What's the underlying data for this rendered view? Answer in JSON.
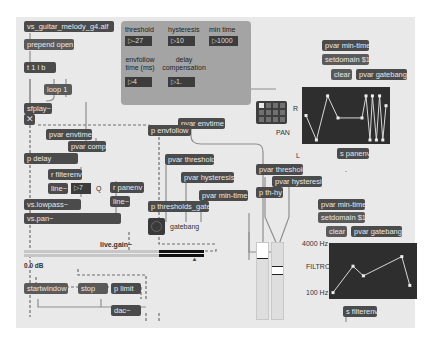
{
  "patch": {
    "objects": {
      "file": "vs_guitar_melody_g4.aif",
      "prepend": "prepend open",
      "trigger": "t 1 l b",
      "loop": "loop 1",
      "sfplay": "sfplay~",
      "pvar_envtime_left": "pvar envtime",
      "pvar_comp": "pvar comp",
      "p_delay": "p delay",
      "r_filterenv": "r filterenv",
      "line_filter": "line~",
      "q_number": "7",
      "q_label": "Q",
      "r_panenv": "r panenv",
      "line_pan": "line~",
      "lowpass": "vs.lowpass~",
      "pan": "vs.pan~",
      "pvar_envtime_right": "pvar envtime",
      "p_envfollow": "p envfollow",
      "pvar_threshold": "pvar threshold",
      "pvar_hysteresis": "pvar hysteresis",
      "pvar_mintime": "pvar min-time",
      "p_thresholds_gate": "p thresholds_gate",
      "gatebang_label": "gatebang",
      "pvar_threshold2": "pvar threshold",
      "pvar_hysteresis2": "pvar hysteresis",
      "p_thhy": "p th-hy",
      "live_gain_label": "live.gain~",
      "gain_value": "0.0 dB",
      "startwindow": "startwindow",
      "stop": "stop",
      "p_limit": "p limit",
      "dac": "dac~",
      "pan_pvar_mintime": "pvar min-time",
      "pan_setdomain": "setdomain $1",
      "pan_clear": "clear",
      "pan_gatebang": "pvar gatebang",
      "s_panenv": "s panenv",
      "filt_pvar_mintime": "pvar min-time",
      "filt_setdomain": "setdomain $1",
      "filt_clear": "clear",
      "filt_gatebang": "pvar gatebang",
      "s_filterenv": "s filterenv"
    },
    "panel": {
      "threshold_label": "threshold",
      "threshold_value": "-27",
      "hysteresis_label": "hysteresis",
      "hysteresis_value": "10",
      "mintime_label": "min time",
      "mintime_value": "1000",
      "envfollow_label": "envfollow time (ms)",
      "envfollow_value": "4",
      "delay_label": "delay compensation",
      "delay_value": "1."
    },
    "pan_function": {
      "label_top": "R",
      "label_mid": "PAN",
      "label_bottom": "L",
      "points": [
        [
          0,
          0.5
        ],
        [
          0.13,
          0.0
        ],
        [
          0.27,
          0.9
        ],
        [
          0.4,
          0.45
        ],
        [
          0.7,
          0.45
        ],
        [
          0.75,
          0.9
        ],
        [
          0.8,
          0.0
        ],
        [
          0.83,
          0.9
        ],
        [
          0.88,
          0.0
        ],
        [
          0.92,
          0.9
        ],
        [
          0.96,
          0.0
        ],
        [
          1.0,
          0.7
        ]
      ]
    },
    "filter_function": {
      "label_top": "4000 Hz",
      "label_mid": "FILTRO",
      "label_bottom": "100 Hz",
      "points": [
        [
          0,
          0.05
        ],
        [
          0.25,
          0.6
        ],
        [
          0.38,
          0.4
        ],
        [
          0.86,
          0.8
        ],
        [
          0.96,
          0.2
        ]
      ]
    },
    "live_gain": {
      "level": 0.75
    },
    "sliders": [
      {
        "value": 0.75
      },
      {
        "value": 0.58
      }
    ]
  }
}
